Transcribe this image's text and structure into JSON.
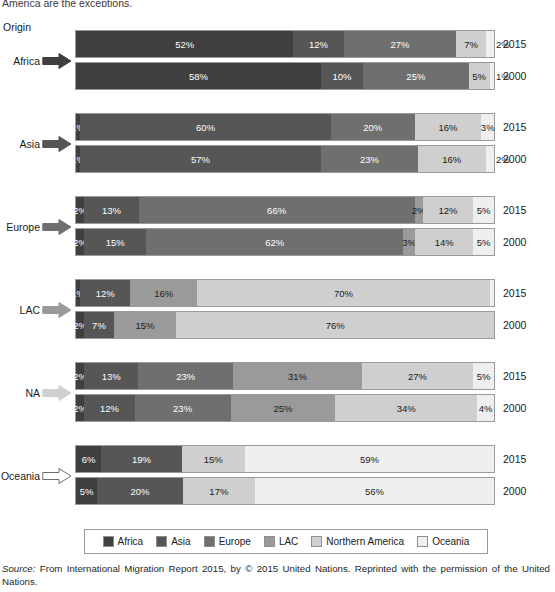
{
  "page": {
    "cut_top_text": "America are the exceptions.",
    "origin_label": "Origin"
  },
  "colors": {
    "africa": "#3f3f3f",
    "asia": "#565656",
    "europe": "#6f6f6f",
    "lac": "#9a9a9a",
    "northern_america": "#cfcfcf",
    "oceania": "#efefef",
    "border": "#9a9a9a",
    "text": "#1a1a1a"
  },
  "legend": {
    "items": [
      {
        "label": "Africa",
        "color": "#3f3f3f"
      },
      {
        "label": "Asia",
        "color": "#565656"
      },
      {
        "label": "Europe",
        "color": "#6f6f6f"
      },
      {
        "label": "LAC",
        "color": "#9a9a9a"
      },
      {
        "label": "Northern America",
        "color": "#cfcfcf"
      },
      {
        "label": "Oceania",
        "color": "#efefef"
      }
    ]
  },
  "source": {
    "prefix": "Source:",
    "text": " From International Migration Report 2015, by © 2015 United Nations. Reprinted with the permission of the United Nations."
  },
  "chart_data": {
    "type": "bar",
    "subtype": "stacked-horizontal-100pct",
    "title": "",
    "xlabel": "",
    "ylabel": "Origin",
    "xlim": [
      0,
      100
    ],
    "grid": false,
    "legend_position": "bottom",
    "unit": "%",
    "series": [
      {
        "name": "Africa",
        "color": "#3f3f3f"
      },
      {
        "name": "Asia",
        "color": "#565656"
      },
      {
        "name": "Europe",
        "color": "#6f6f6f"
      },
      {
        "name": "LAC",
        "color": "#9a9a9a"
      },
      {
        "name": "Northern America",
        "color": "#cfcfcf"
      },
      {
        "name": "Oceania",
        "color": "#efefef"
      }
    ],
    "groups": [
      {
        "origin": "Africa",
        "arrow_color": "#3f3f3f",
        "arrow_filled": true,
        "rows": [
          {
            "year": "2015",
            "segments": [
              {
                "dest": "Africa",
                "value": 52,
                "label": "52%",
                "show": true,
                "outside": false
              },
              {
                "dest": "Asia",
                "value": 12,
                "label": "12%",
                "show": true,
                "outside": false
              },
              {
                "dest": "Europe",
                "value": 27,
                "label": "27%",
                "show": true,
                "outside": false
              },
              {
                "dest": "LAC",
                "value": 0,
                "label": "",
                "show": false,
                "outside": false
              },
              {
                "dest": "Northern America",
                "value": 7,
                "label": "7%",
                "show": true,
                "outside": false
              },
              {
                "dest": "Oceania",
                "value": 2,
                "label": "2%",
                "show": true,
                "outside": true
              }
            ]
          },
          {
            "year": "2000",
            "segments": [
              {
                "dest": "Africa",
                "value": 58,
                "label": "58%",
                "show": true,
                "outside": false
              },
              {
                "dest": "Asia",
                "value": 10,
                "label": "10%",
                "show": true,
                "outside": false
              },
              {
                "dest": "Europe",
                "value": 25,
                "label": "25%",
                "show": true,
                "outside": false
              },
              {
                "dest": "LAC",
                "value": 0,
                "label": "",
                "show": false,
                "outside": false
              },
              {
                "dest": "Northern America",
                "value": 5,
                "label": "5%",
                "show": true,
                "outside": false
              },
              {
                "dest": "Oceania",
                "value": 1,
                "label": "1%",
                "show": true,
                "outside": true
              }
            ]
          }
        ]
      },
      {
        "origin": "Asia",
        "arrow_color": "#565656",
        "arrow_filled": true,
        "rows": [
          {
            "year": "2015",
            "segments": [
              {
                "dest": "Africa",
                "value": 1,
                "label": "1%",
                "show": true,
                "outside": false
              },
              {
                "dest": "Asia",
                "value": 60,
                "label": "60%",
                "show": true,
                "outside": false
              },
              {
                "dest": "Europe",
                "value": 20,
                "label": "20%",
                "show": true,
                "outside": false
              },
              {
                "dest": "LAC",
                "value": 0,
                "label": "",
                "show": false,
                "outside": false
              },
              {
                "dest": "Northern America",
                "value": 16,
                "label": "16%",
                "show": true,
                "outside": false
              },
              {
                "dest": "Oceania",
                "value": 3,
                "label": "3%",
                "show": true,
                "outside": false
              }
            ]
          },
          {
            "year": "2000",
            "segments": [
              {
                "dest": "Africa",
                "value": 1,
                "label": "1%",
                "show": true,
                "outside": false
              },
              {
                "dest": "Asia",
                "value": 57,
                "label": "57%",
                "show": true,
                "outside": false
              },
              {
                "dest": "Europe",
                "value": 23,
                "label": "23%",
                "show": true,
                "outside": false
              },
              {
                "dest": "LAC",
                "value": 0,
                "label": "",
                "show": false,
                "outside": false
              },
              {
                "dest": "Northern America",
                "value": 16,
                "label": "16%",
                "show": true,
                "outside": false
              },
              {
                "dest": "Oceania",
                "value": 2,
                "label": "2%",
                "show": true,
                "outside": true
              }
            ]
          }
        ]
      },
      {
        "origin": "Europe",
        "arrow_color": "#6f6f6f",
        "arrow_filled": true,
        "rows": [
          {
            "year": "2015",
            "segments": [
              {
                "dest": "Africa",
                "value": 2,
                "label": "2%",
                "show": true,
                "outside": false
              },
              {
                "dest": "Asia",
                "value": 13,
                "label": "13%",
                "show": true,
                "outside": false
              },
              {
                "dest": "Europe",
                "value": 66,
                "label": "66%",
                "show": true,
                "outside": false
              },
              {
                "dest": "LAC",
                "value": 2,
                "label": "2%",
                "show": true,
                "outside": false
              },
              {
                "dest": "Northern America",
                "value": 12,
                "label": "12%",
                "show": true,
                "outside": false
              },
              {
                "dest": "Oceania",
                "value": 5,
                "label": "5%",
                "show": true,
                "outside": false
              }
            ]
          },
          {
            "year": "2000",
            "segments": [
              {
                "dest": "Africa",
                "value": 2,
                "label": "2%",
                "show": true,
                "outside": false
              },
              {
                "dest": "Asia",
                "value": 15,
                "label": "15%",
                "show": true,
                "outside": false
              },
              {
                "dest": "Europe",
                "value": 62,
                "label": "62%",
                "show": true,
                "outside": false
              },
              {
                "dest": "LAC",
                "value": 3,
                "label": "3%",
                "show": true,
                "outside": false
              },
              {
                "dest": "Northern America",
                "value": 14,
                "label": "14%",
                "show": true,
                "outside": false
              },
              {
                "dest": "Oceania",
                "value": 5,
                "label": "5%",
                "show": true,
                "outside": false
              }
            ]
          }
        ]
      },
      {
        "origin": "LAC",
        "arrow_color": "#9a9a9a",
        "arrow_filled": true,
        "rows": [
          {
            "year": "2015",
            "segments": [
              {
                "dest": "Africa",
                "value": 1,
                "label": "1%",
                "show": true,
                "outside": false
              },
              {
                "dest": "Asia",
                "value": 12,
                "label": "12%",
                "show": true,
                "outside": false
              },
              {
                "dest": "Europe",
                "value": 0,
                "label": "",
                "show": false,
                "outside": false
              },
              {
                "dest": "LAC",
                "value": 16,
                "label": "16%",
                "show": true,
                "outside": false
              },
              {
                "dest": "Northern America",
                "value": 70,
                "label": "70%",
                "show": true,
                "outside": false
              },
              {
                "dest": "Oceania",
                "value": 1,
                "label": "",
                "show": false,
                "outside": false
              }
            ]
          },
          {
            "year": "2000",
            "segments": [
              {
                "dest": "Africa",
                "value": 2,
                "label": "2%",
                "show": true,
                "outside": false
              },
              {
                "dest": "Asia",
                "value": 7,
                "label": "7%",
                "show": true,
                "outside": false
              },
              {
                "dest": "Europe",
                "value": 0,
                "label": "",
                "show": false,
                "outside": false
              },
              {
                "dest": "LAC",
                "value": 15,
                "label": "15%",
                "show": true,
                "outside": false
              },
              {
                "dest": "Northern America",
                "value": 76,
                "label": "76%",
                "show": true,
                "outside": false
              },
              {
                "dest": "Oceania",
                "value": 0,
                "label": "",
                "show": false,
                "outside": false
              }
            ]
          }
        ]
      },
      {
        "origin": "NA",
        "arrow_color": "#cfcfcf",
        "arrow_filled": true,
        "rows": [
          {
            "year": "2015",
            "segments": [
              {
                "dest": "Africa",
                "value": 2,
                "label": "2%",
                "show": true,
                "outside": false
              },
              {
                "dest": "Asia",
                "value": 13,
                "label": "13%",
                "show": true,
                "outside": false
              },
              {
                "dest": "Europe",
                "value": 23,
                "label": "23%",
                "show": true,
                "outside": false
              },
              {
                "dest": "LAC",
                "value": 31,
                "label": "31%",
                "show": true,
                "outside": false
              },
              {
                "dest": "Northern America",
                "value": 27,
                "label": "27%",
                "show": true,
                "outside": false
              },
              {
                "dest": "Oceania",
                "value": 5,
                "label": "5%",
                "show": true,
                "outside": false
              }
            ]
          },
          {
            "year": "2000",
            "segments": [
              {
                "dest": "Africa",
                "value": 2,
                "label": "2%",
                "show": true,
                "outside": false
              },
              {
                "dest": "Asia",
                "value": 12,
                "label": "12%",
                "show": true,
                "outside": false
              },
              {
                "dest": "Europe",
                "value": 23,
                "label": "23%",
                "show": true,
                "outside": false
              },
              {
                "dest": "LAC",
                "value": 25,
                "label": "25%",
                "show": true,
                "outside": false
              },
              {
                "dest": "Northern America",
                "value": 34,
                "label": "34%",
                "show": true,
                "outside": false
              },
              {
                "dest": "Oceania",
                "value": 4,
                "label": "4%",
                "show": true,
                "outside": false
              }
            ]
          }
        ]
      },
      {
        "origin": "Oceania",
        "arrow_color": "#ffffff",
        "arrow_filled": false,
        "rows": [
          {
            "year": "2015",
            "segments": [
              {
                "dest": "Africa",
                "value": 6,
                "label": "6%",
                "show": true,
                "outside": false
              },
              {
                "dest": "Asia",
                "value": 19,
                "label": "19%",
                "show": true,
                "outside": false
              },
              {
                "dest": "Europe",
                "value": 0,
                "label": "",
                "show": false,
                "outside": false
              },
              {
                "dest": "LAC",
                "value": 0,
                "label": "",
                "show": false,
                "outside": false
              },
              {
                "dest": "Northern America",
                "value": 15,
                "label": "15%",
                "show": true,
                "outside": false
              },
              {
                "dest": "Oceania",
                "value": 59,
                "label": "59%",
                "show": true,
                "outside": false
              }
            ]
          },
          {
            "year": "2000",
            "segments": [
              {
                "dest": "Africa",
                "value": 5,
                "label": "5%",
                "show": true,
                "outside": false
              },
              {
                "dest": "Asia",
                "value": 20,
                "label": "20%",
                "show": true,
                "outside": false
              },
              {
                "dest": "Europe",
                "value": 0,
                "label": "",
                "show": false,
                "outside": false
              },
              {
                "dest": "LAC",
                "value": 0,
                "label": "",
                "show": false,
                "outside": false
              },
              {
                "dest": "Northern America",
                "value": 17,
                "label": "17%",
                "show": true,
                "outside": false
              },
              {
                "dest": "Oceania",
                "value": 56,
                "label": "56%",
                "show": true,
                "outside": false
              }
            ]
          }
        ]
      }
    ]
  }
}
